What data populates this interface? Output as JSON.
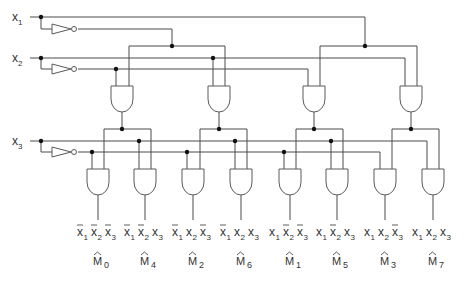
{
  "diagram": {
    "inputs": [
      {
        "name": "x1",
        "label": "x",
        "sub": "1"
      },
      {
        "name": "x2",
        "label": "x",
        "sub": "2"
      },
      {
        "name": "x3",
        "label": "x",
        "sub": "3"
      }
    ],
    "outputs": [
      {
        "term": [
          [
            "x",
            "1",
            true
          ],
          [
            "x",
            "2",
            true
          ],
          [
            "x",
            "3",
            true
          ]
        ],
        "m": "M",
        "msub": "0"
      },
      {
        "term": [
          [
            "x",
            "1",
            true
          ],
          [
            "x",
            "2",
            true
          ],
          [
            "x",
            "3",
            false
          ]
        ],
        "m": "M",
        "msub": "4"
      },
      {
        "term": [
          [
            "x",
            "1",
            true
          ],
          [
            "x",
            "2",
            false
          ],
          [
            "x",
            "3",
            true
          ]
        ],
        "m": "M",
        "msub": "2"
      },
      {
        "term": [
          [
            "x",
            "1",
            true
          ],
          [
            "x",
            "2",
            false
          ],
          [
            "x",
            "3",
            false
          ]
        ],
        "m": "M",
        "msub": "6"
      },
      {
        "term": [
          [
            "x",
            "1",
            false
          ],
          [
            "x",
            "2",
            true
          ],
          [
            "x",
            "3",
            true
          ]
        ],
        "m": "M",
        "msub": "1"
      },
      {
        "term": [
          [
            "x",
            "1",
            false
          ],
          [
            "x",
            "2",
            true
          ],
          [
            "x",
            "3",
            false
          ]
        ],
        "m": "M",
        "msub": "5"
      },
      {
        "term": [
          [
            "x",
            "1",
            false
          ],
          [
            "x",
            "2",
            false
          ],
          [
            "x",
            "3",
            true
          ]
        ],
        "m": "M",
        "msub": "3"
      },
      {
        "term": [
          [
            "x",
            "1",
            false
          ],
          [
            "x",
            "2",
            false
          ],
          [
            "x",
            "3",
            false
          ]
        ],
        "m": "M",
        "msub": "7"
      }
    ],
    "colors": {
      "wire": "#4a4a4a",
      "dot": "#111111",
      "text": "#333333"
    }
  }
}
